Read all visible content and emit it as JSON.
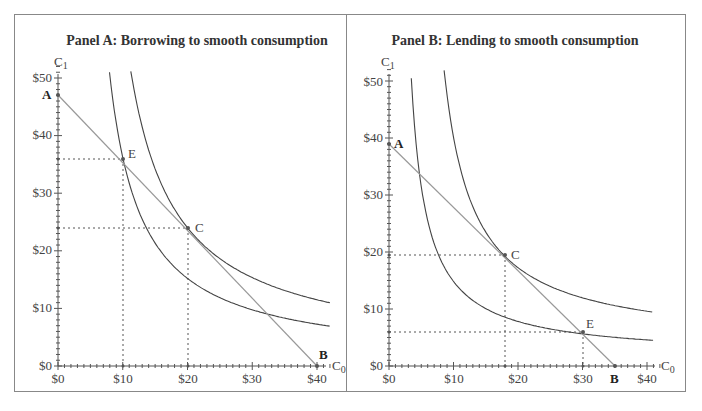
{
  "chart_data": [
    {
      "type": "line",
      "title": "Panel A: Borrowing to smooth consumption",
      "xlabel": "C0",
      "ylabel": "C1",
      "xlim": [
        0,
        42
      ],
      "ylim": [
        0,
        52
      ],
      "x_ticks": [
        "$0",
        "$10",
        "$20",
        "$30",
        "$40"
      ],
      "y_ticks": [
        "$0",
        "$10",
        "$20",
        "$30",
        "$40",
        "$50"
      ],
      "grid": false,
      "series": [
        {
          "name": "Budget line AB",
          "points": [
            [
              0,
              47
            ],
            [
              40,
              0
            ]
          ]
        },
        {
          "name": "Indifference curve through E",
          "shape": "convex"
        },
        {
          "name": "Indifference curve through C",
          "shape": "convex"
        }
      ],
      "points": [
        {
          "label": "A",
          "x": 0,
          "y": 47
        },
        {
          "label": "E",
          "x": 10,
          "y": 36
        },
        {
          "label": "C",
          "x": 20,
          "y": 24
        },
        {
          "label": "B",
          "x": 40,
          "y": 0
        }
      ]
    },
    {
      "type": "line",
      "title": "Panel B: Lending to smooth consumption",
      "xlabel": "C0",
      "ylabel": "C1",
      "xlim": [
        0,
        42
      ],
      "ylim": [
        0,
        52
      ],
      "x_ticks": [
        "$0",
        "$10",
        "$20",
        "$30",
        "$40"
      ],
      "y_ticks": [
        "$0",
        "$10",
        "$20",
        "$30",
        "$40",
        "$50"
      ],
      "grid": false,
      "series": [
        {
          "name": "Budget line AB",
          "points": [
            [
              0,
              39
            ],
            [
              35,
              0
            ]
          ]
        },
        {
          "name": "Indifference curve through E",
          "shape": "convex"
        },
        {
          "name": "Indifference curve through C",
          "shape": "convex"
        }
      ],
      "points": [
        {
          "label": "A",
          "x": 0,
          "y": 39
        },
        {
          "label": "C",
          "x": 18,
          "y": 19.5
        },
        {
          "label": "E",
          "x": 30,
          "y": 6
        },
        {
          "label": "B",
          "x": 35,
          "y": 0
        }
      ]
    }
  ],
  "panels": {
    "a": {
      "title": "Panel A: Borrowing to smooth consumption",
      "ylabel": "C",
      "ysub": "1",
      "xlabel": "C",
      "xsub": "0",
      "yticks": [
        "$0",
        "$10",
        "$20",
        "$30",
        "$40",
        "$50"
      ],
      "xticks": [
        "$0",
        "$10",
        "$20",
        "$30",
        "$40"
      ],
      "pA": "A",
      "pB": "B",
      "pC": "C",
      "pE": "E"
    },
    "b": {
      "title": "Panel B: Lending to smooth consumption",
      "ylabel": "C",
      "ysub": "1",
      "xlabel": "C",
      "xsub": "0",
      "yticks": [
        "$0",
        "$10",
        "$20",
        "$30",
        "$40",
        "$50"
      ],
      "xticks": [
        "$0",
        "$10",
        "$20",
        "$30",
        "$40"
      ],
      "pA": "A",
      "pB": "B",
      "pC": "C",
      "pE": "E"
    }
  }
}
